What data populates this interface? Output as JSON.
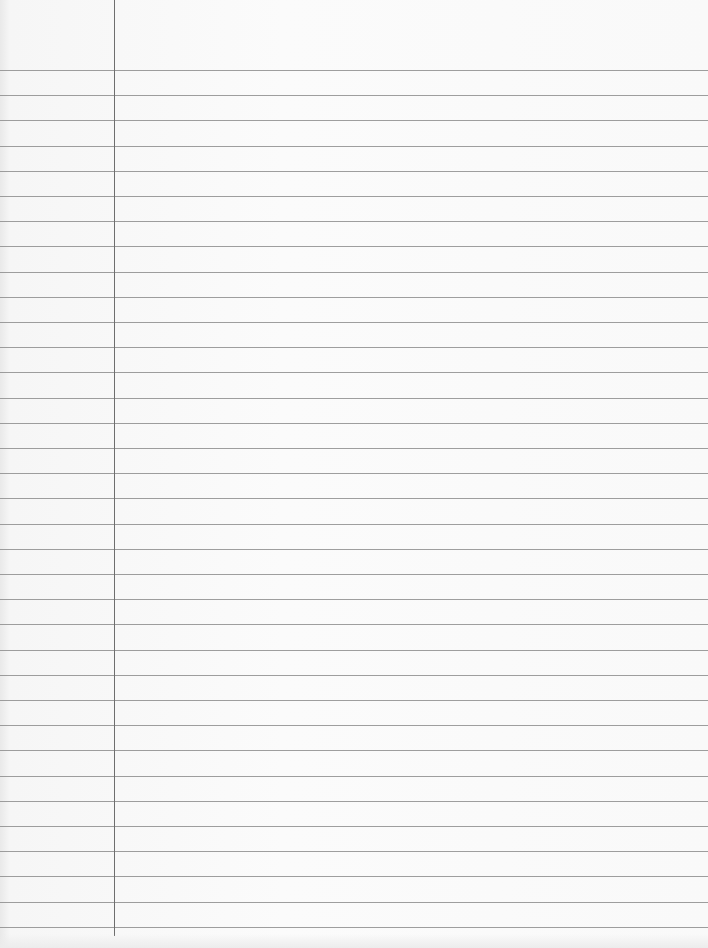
{
  "paper": {
    "type": "lined notebook paper",
    "background_color": "#f9f9f9",
    "rule_color": "#8d8d8d",
    "margin_color": "#6e6e6e",
    "margin_x": 114,
    "first_rule_y": 70,
    "rule_spacing": 25.2,
    "rule_count": 35,
    "text": ""
  }
}
